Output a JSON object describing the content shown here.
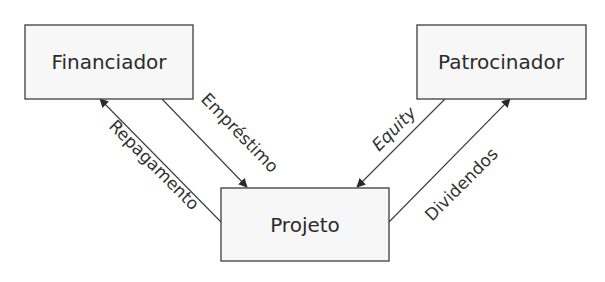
{
  "diagram": {
    "nodes": {
      "financiador": {
        "label": "Financiador"
      },
      "patrocinador": {
        "label": "Patrocinador"
      },
      "projeto": {
        "label": "Projeto"
      }
    },
    "edges": {
      "emprestimo": {
        "label": "Empréstimo",
        "from": "Financiador",
        "to": "Projeto"
      },
      "repagamento": {
        "label": "Repagamento",
        "from": "Projeto",
        "to": "Financiador"
      },
      "equity": {
        "label": "Equity",
        "from": "Patrocinador",
        "to": "Projeto"
      },
      "dividendos": {
        "label": "Dividendos",
        "from": "Projeto",
        "to": "Patrocinador"
      }
    }
  }
}
